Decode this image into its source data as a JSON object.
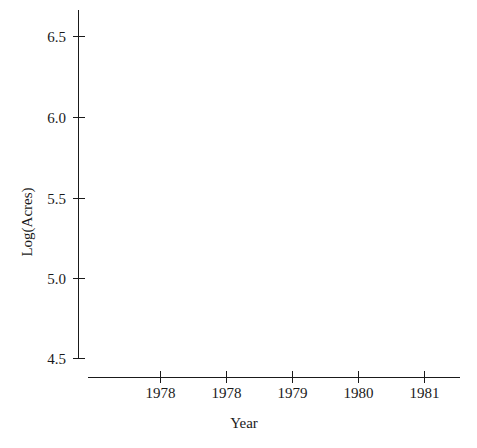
{
  "chart_data": {
    "type": "scatter",
    "title": "",
    "subtitle": "",
    "xlabel": "Year",
    "ylabel": "Log(Acres)",
    "x_tick_labels": [
      "1978",
      "1978",
      "1979",
      "1980",
      "1981"
    ],
    "y_tick_labels": [
      "6.5",
      "6.0",
      "5.5",
      "5.0",
      "4.5"
    ],
    "y_tick_values": [
      6.5,
      6.0,
      5.5,
      5.0,
      4.5
    ],
    "ylim": [
      4.5,
      6.7
    ],
    "grid": false,
    "legend": null,
    "series": [],
    "values": [],
    "annotations": [],
    "note": "Plot area contains no plotted data points"
  },
  "axes": {
    "y_axis_label": "Log(Acres)",
    "x_axis_label": "Year",
    "y_ticks": [
      {
        "label": "6.5"
      },
      {
        "label": "6.0"
      },
      {
        "label": "5.5"
      },
      {
        "label": "5.0"
      },
      {
        "label": "4.5"
      }
    ],
    "x_ticks": [
      {
        "label": "1978"
      },
      {
        "label": "1978"
      },
      {
        "label": "1979"
      },
      {
        "label": "1980"
      },
      {
        "label": "1981"
      }
    ]
  },
  "style": {
    "background_color": "#ffffff",
    "axis_color": "#1a1a1a",
    "text_color": "#1a1a1a"
  }
}
